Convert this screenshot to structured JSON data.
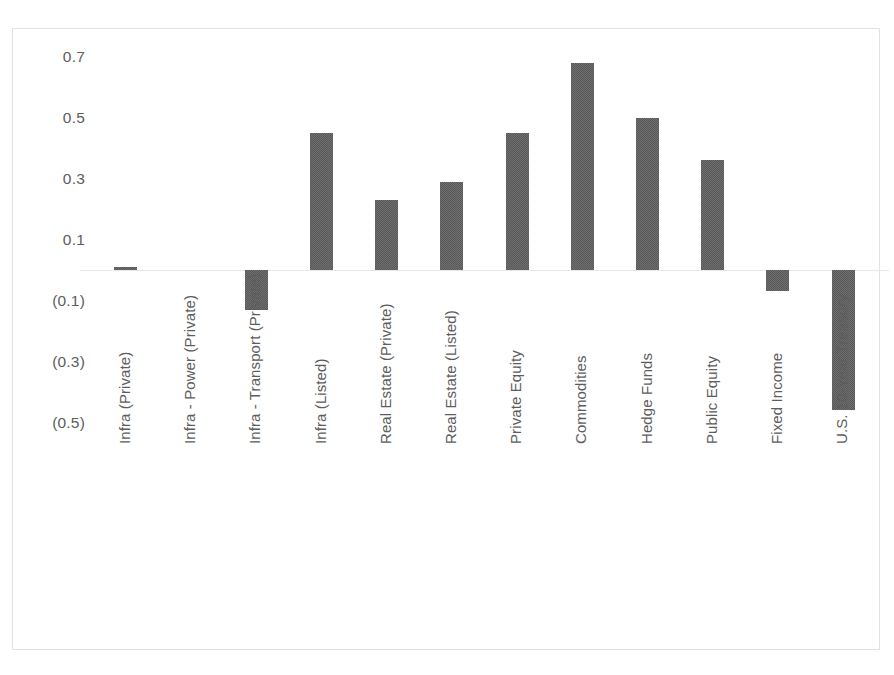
{
  "chart_data": {
    "type": "bar",
    "title": "",
    "subtitle": "",
    "xlabel": "",
    "ylabel": "",
    "grid": false,
    "legend": false,
    "ylim": [
      -0.5,
      0.8
    ],
    "y_ticks": [
      0.7,
      0.5,
      0.3,
      0.1,
      -0.1,
      -0.3,
      -0.5
    ],
    "y_tick_labels": [
      "0.7",
      "0.5",
      "0.3",
      "0.1",
      "(0.1)",
      "(0.3)",
      "(0.5)"
    ],
    "zero_line": 0,
    "bar_color": "#595959",
    "categories": [
      "Infra (Private)",
      "Infra - Power (Private)",
      "Infra - Transport (Private)",
      "Infra (Listed)",
      "Real Estate (Private)",
      "Real Estate (Listed)",
      "Private Equity",
      "Commodities",
      "Hedge Funds",
      "Public Equity",
      "Fixed Income",
      "U.S. 10-Year Treasury"
    ],
    "values": [
      0.01,
      0.0,
      -0.13,
      0.45,
      0.23,
      0.29,
      0.45,
      0.68,
      0.5,
      0.36,
      -0.07,
      -0.46
    ]
  },
  "axis": {
    "y_labels": [
      "0.7",
      "0.5",
      "0.3",
      "0.1",
      "(0.1)",
      "(0.3)",
      "(0.5)"
    ],
    "x_labels": [
      "Infra (Private)",
      "Infra - Power (Private)",
      "Infra - Transport (Private)",
      "Infra (Listed)",
      "Real Estate (Private)",
      "Real Estate (Listed)",
      "Private Equity",
      "Commodities",
      "Hedge Funds",
      "Public Equity",
      "Fixed Income",
      "U.S. 10-Year Treasury"
    ]
  },
  "style": {
    "bar_color": "#595959",
    "border_color": "#e2e2e2",
    "zero_line_color": "#e8e8e8",
    "text_color": "#5d5d5d",
    "background": "#ffffff"
  }
}
